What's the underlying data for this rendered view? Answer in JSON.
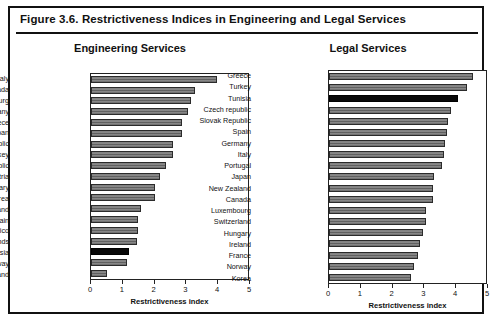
{
  "figure": {
    "number": "Figure 3.6.",
    "title": "Figure 3.6.   Restrictiveness Indices in Engineering and Legal Services"
  },
  "axis": {
    "label": "Restrictiveness index",
    "ticks": [
      "0",
      "1",
      "2",
      "3",
      "4",
      "5"
    ],
    "min": 0,
    "max": 5
  },
  "colors": {
    "bar_fill": "#7a7a7a",
    "bar_border": "#2b2b2b",
    "highlight_fill": "#080808",
    "frame": "#111111",
    "text": "#111111"
  },
  "panels": {
    "engineering": {
      "title": "Engineering Services"
    },
    "legal": {
      "title": "Legal Services"
    }
  },
  "chart_data": [
    {
      "type": "bar",
      "orientation": "horizontal",
      "title": "Engineering Services",
      "xlabel": "Restrictiveness index",
      "ylabel": "",
      "xlim": [
        0,
        5
      ],
      "grid": false,
      "legend": "none",
      "highlight": "Tunisia",
      "categories": [
        "Italy",
        "Canada",
        "Luxembourg",
        "Germany",
        "Greece",
        "Japan",
        "Slovak Republic",
        "Turkey",
        "Czech republic",
        "Austria",
        "Hungary",
        "Korea",
        "New Zealand",
        "Spain",
        "Mexico",
        "Netherlands",
        "Tunisia",
        "Norway",
        "Finland"
      ],
      "values": [
        4.0,
        3.3,
        3.2,
        3.1,
        2.9,
        2.9,
        2.6,
        2.6,
        2.4,
        2.2,
        2.05,
        2.05,
        1.6,
        1.5,
        1.5,
        1.45,
        1.2,
        1.15,
        0.5
      ]
    },
    {
      "type": "bar",
      "orientation": "horizontal",
      "title": "Legal Services",
      "xlabel": "Restrictiveness index",
      "ylabel": "",
      "xlim": [
        0,
        5
      ],
      "grid": false,
      "legend": "none",
      "highlight": "Tunisia",
      "categories": [
        "Greece",
        "Turkey",
        "Tunisia",
        "Czech republic",
        "Slovak Republic",
        "Spain",
        "Germany",
        "Italy",
        "Portugal",
        "Japan",
        "New Zealand",
        "Canada",
        "Luxembourg",
        "Switzerland",
        "Hungary",
        "Ireland",
        "France",
        "Norway",
        "Korea"
      ],
      "values": [
        4.6,
        4.4,
        4.1,
        3.9,
        3.8,
        3.75,
        3.7,
        3.65,
        3.6,
        3.35,
        3.3,
        3.3,
        3.1,
        3.1,
        3.0,
        2.9,
        2.85,
        2.7,
        2.6
      ]
    }
  ]
}
